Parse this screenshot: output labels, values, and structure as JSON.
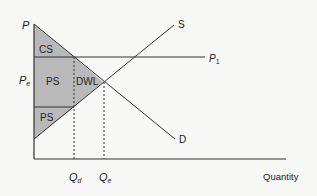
{
  "diagram": {
    "axes": {
      "y_label": "P",
      "x_label": "Quantity"
    },
    "curves": {
      "supply_label": "S",
      "demand_label": "D",
      "price_line_label": "P",
      "price_line_subscript": "1"
    },
    "price_labels": {
      "equilibrium": "P",
      "equilibrium_subscript": "e"
    },
    "quantity_labels": {
      "qd": "Q",
      "qd_subscript": "d",
      "qe": "Q",
      "qe_subscript": "e"
    },
    "regions": {
      "consumer_surplus": "CS",
      "producer_surplus_upper": "PS",
      "producer_surplus_lower": "PS",
      "deadweight_loss": "DWL"
    },
    "colors": {
      "shade": "#b9b9b9",
      "line": "#333333",
      "background": "#f7f7f5"
    }
  }
}
